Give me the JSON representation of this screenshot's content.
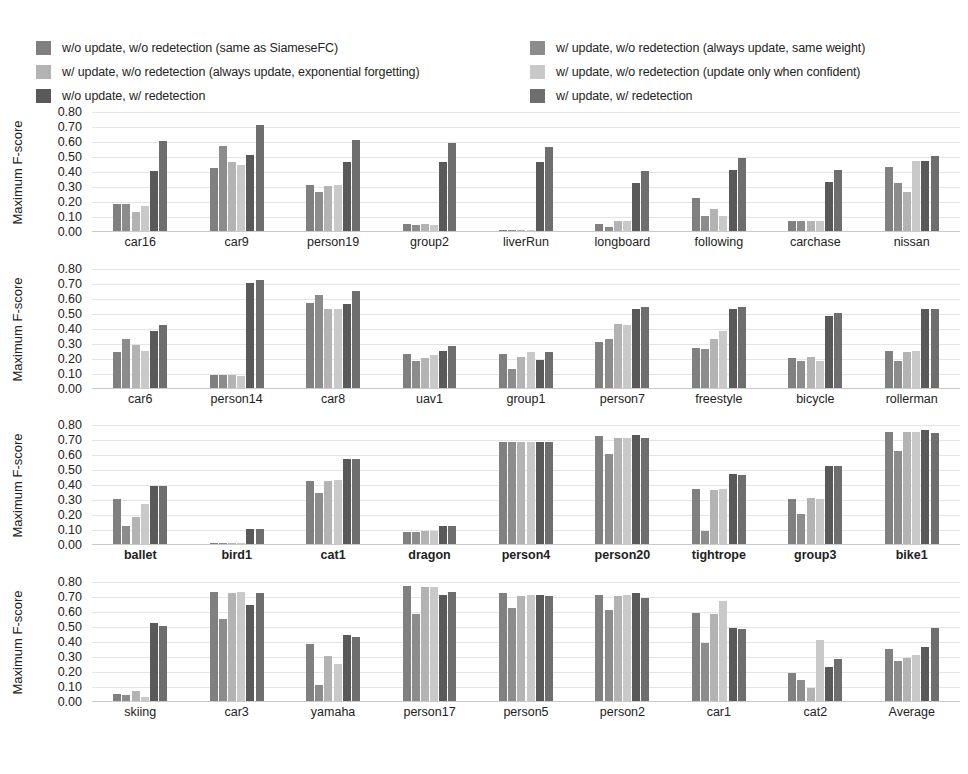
{
  "legend": {
    "left_items": [
      {
        "label": "w/o update, w/o redetection (same as SiameseFC)",
        "color": "#808080"
      },
      {
        "label": "w/ update, w/o redetection (always update, exponential forgetting)",
        "color": "#b3b3b3"
      },
      {
        "label": "w/o update, w/ redetection",
        "color": "#595959"
      }
    ],
    "right_items": [
      {
        "label": "w/ update, w/o redetection (always update, same weight)",
        "color": "#8c8c8c"
      },
      {
        "label": "w/ update, w/o redetection (update only when confident)",
        "color": "#c9c9c9"
      },
      {
        "label": "w/ update, w/ redetection",
        "color": "#6e6e6e"
      }
    ]
  },
  "chart_data": {
    "type": "bar",
    "title": "",
    "xlabel": "",
    "ylabel": "Maximum F-score",
    "ylim": [
      0.0,
      0.8
    ],
    "yticks": [
      "0.80",
      "0.70",
      "0.60",
      "0.50",
      "0.40",
      "0.30",
      "0.20",
      "0.10",
      "0.00"
    ],
    "ytick_values": [
      0.8,
      0.7,
      0.6,
      0.5,
      0.4,
      0.3,
      0.2,
      0.1,
      0.0
    ],
    "grid": true,
    "legend_position": "top",
    "series_names": [
      "w/o update, w/o redetection (same as SiameseFC)",
      "w/ update, w/o redetection (always update, exponential forgetting)",
      "w/ update, w/o redetection (always update, same weight)",
      "w/ update, w/o redetection (update only when confident)",
      "w/o update, w/ redetection",
      "w/ update, w/ redetection"
    ],
    "series_colors": [
      "#808080",
      "#8c8c8c",
      "#b3b3b3",
      "#c9c9c9",
      "#595959",
      "#6e6e6e"
    ],
    "panels": [
      {
        "ylabel": "Maximum F-score",
        "bold_labels": false,
        "categories": [
          "car16",
          "car9",
          "person19",
          "group2",
          "liverRun",
          "longboard",
          "following",
          "carchase",
          "nissan"
        ],
        "values": [
          [
            0.18,
            0.18,
            0.13,
            0.17,
            0.4,
            0.6
          ],
          [
            0.42,
            0.57,
            0.46,
            0.44,
            0.51,
            0.71
          ],
          [
            0.31,
            0.26,
            0.3,
            0.31,
            0.46,
            0.61
          ],
          [
            0.05,
            0.04,
            0.05,
            0.04,
            0.46,
            0.59
          ],
          [
            0.01,
            0.01,
            0.01,
            0.01,
            0.46,
            0.56
          ],
          [
            0.05,
            0.03,
            0.07,
            0.07,
            0.32,
            0.4
          ],
          [
            0.22,
            0.1,
            0.15,
            0.1,
            0.41,
            0.49
          ],
          [
            0.07,
            0.07,
            0.07,
            0.07,
            0.33,
            0.41
          ],
          [
            0.43,
            0.32,
            0.26,
            0.47,
            0.47,
            0.5
          ]
        ]
      },
      {
        "ylabel": "Maximum F-score",
        "bold_labels": false,
        "categories": [
          "car6",
          "person14",
          "car8",
          "uav1",
          "group1",
          "person7",
          "freestyle",
          "bicycle",
          "rollerman"
        ],
        "values": [
          [
            0.24,
            0.33,
            0.29,
            0.25,
            0.38,
            0.42
          ],
          [
            0.09,
            0.09,
            0.09,
            0.08,
            0.7,
            0.72
          ],
          [
            0.57,
            0.62,
            0.53,
            0.53,
            0.56,
            0.65
          ],
          [
            0.23,
            0.18,
            0.2,
            0.22,
            0.25,
            0.28
          ],
          [
            0.23,
            0.13,
            0.21,
            0.24,
            0.19,
            0.24
          ],
          [
            0.31,
            0.33,
            0.43,
            0.42,
            0.53,
            0.54
          ],
          [
            0.27,
            0.26,
            0.33,
            0.38,
            0.53,
            0.54
          ],
          [
            0.2,
            0.18,
            0.21,
            0.18,
            0.48,
            0.5
          ],
          [
            0.25,
            0.18,
            0.24,
            0.25,
            0.53,
            0.53
          ]
        ]
      },
      {
        "ylabel": "Maximum F-score",
        "bold_labels": true,
        "categories": [
          "ballet",
          "bird1",
          "cat1",
          "dragon",
          "person4",
          "person20",
          "tightrope",
          "group3",
          "bike1"
        ],
        "values": [
          [
            0.3,
            0.12,
            0.18,
            0.27,
            0.39,
            0.39
          ],
          [
            0.01,
            0.01,
            0.01,
            0.01,
            0.1,
            0.1
          ],
          [
            0.42,
            0.34,
            0.42,
            0.43,
            0.57,
            0.57
          ],
          [
            0.08,
            0.08,
            0.09,
            0.09,
            0.12,
            0.12
          ],
          [
            0.68,
            0.68,
            0.68,
            0.68,
            0.68,
            0.68
          ],
          [
            0.72,
            0.6,
            0.71,
            0.71,
            0.73,
            0.71
          ],
          [
            0.37,
            0.09,
            0.36,
            0.37,
            0.47,
            0.46
          ],
          [
            0.3,
            0.2,
            0.31,
            0.3,
            0.52,
            0.52
          ],
          [
            0.75,
            0.62,
            0.75,
            0.75,
            0.76,
            0.74
          ]
        ]
      },
      {
        "ylabel": "Maximum F-score",
        "bold_labels": false,
        "categories": [
          "skiing",
          "car3",
          "yamaha",
          "person17",
          "person5",
          "person2",
          "car1",
          "cat2",
          "Average"
        ],
        "values": [
          [
            0.05,
            0.04,
            0.07,
            0.03,
            0.52,
            0.5
          ],
          [
            0.73,
            0.55,
            0.72,
            0.73,
            0.64,
            0.72
          ],
          [
            0.38,
            0.11,
            0.3,
            0.25,
            0.44,
            0.43
          ],
          [
            0.77,
            0.58,
            0.76,
            0.76,
            0.71,
            0.73
          ],
          [
            0.72,
            0.62,
            0.7,
            0.71,
            0.71,
            0.7
          ],
          [
            0.71,
            0.61,
            0.7,
            0.71,
            0.72,
            0.69
          ],
          [
            0.59,
            0.39,
            0.58,
            0.67,
            0.49,
            0.48
          ],
          [
            0.19,
            0.14,
            0.09,
            0.41,
            0.23,
            0.28
          ],
          [
            0.35,
            0.27,
            0.29,
            0.31,
            0.36,
            0.49
          ]
        ]
      }
    ]
  }
}
